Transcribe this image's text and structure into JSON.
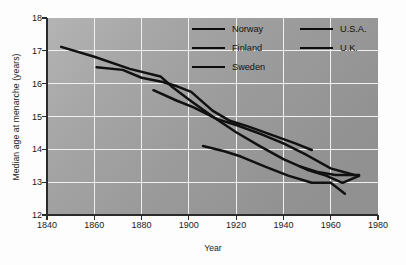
{
  "chart_data": {
    "type": "line",
    "title": "",
    "xlabel": "Year",
    "ylabel": "Median age at menarche (years)",
    "xlim": [
      1840,
      1980
    ],
    "ylim": [
      12,
      18
    ],
    "xticks": [
      1840,
      1860,
      1880,
      1900,
      1920,
      1940,
      1960,
      1980
    ],
    "yticks": [
      12,
      13,
      14,
      15,
      16,
      17,
      18
    ],
    "grid": true,
    "legend_position": "top-center",
    "line_color": "#111111",
    "plot_background": "#9a9a9a",
    "grid_color": "#f2f2f2",
    "series": [
      {
        "name": "Norway",
        "points": [
          [
            1846,
            17.12
          ],
          [
            1860,
            16.82
          ],
          [
            1875,
            16.45
          ],
          [
            1888,
            16.22
          ],
          [
            1893,
            15.9
          ],
          [
            1900,
            15.52
          ],
          [
            1910,
            15.0
          ],
          [
            1920,
            14.52
          ],
          [
            1930,
            14.1
          ],
          [
            1940,
            13.7
          ],
          [
            1950,
            13.38
          ],
          [
            1958,
            13.2
          ],
          [
            1965,
            12.98
          ],
          [
            1972,
            13.19
          ]
        ]
      },
      {
        "name": "Finland",
        "points": [
          [
            1861,
            16.5
          ],
          [
            1872,
            16.42
          ],
          [
            1880,
            16.18
          ],
          [
            1889,
            16.05
          ],
          [
            1895,
            15.92
          ],
          [
            1901,
            15.75
          ],
          [
            1910,
            15.18
          ],
          [
            1917,
            14.88
          ],
          [
            1925,
            14.7
          ],
          [
            1935,
            14.44
          ],
          [
            1945,
            14.18
          ],
          [
            1952,
            13.98
          ]
        ]
      },
      {
        "name": "Sweden",
        "points": [
          [
            1885,
            15.8
          ],
          [
            1895,
            15.48
          ],
          [
            1902,
            15.28
          ],
          [
            1912,
            14.92
          ],
          [
            1920,
            14.74
          ],
          [
            1930,
            14.48
          ],
          [
            1940,
            14.18
          ],
          [
            1950,
            13.82
          ],
          [
            1960,
            13.42
          ],
          [
            1970,
            13.22
          ]
        ]
      },
      {
        "name": "U.S.A.",
        "points": [
          [
            1947,
            13.48
          ],
          [
            1955,
            13.3
          ],
          [
            1962,
            13.22
          ],
          [
            1972,
            13.22
          ]
        ]
      },
      {
        "name": "U.K.",
        "points": [
          [
            1906,
            14.1
          ],
          [
            1915,
            13.94
          ],
          [
            1922,
            13.78
          ],
          [
            1932,
            13.48
          ],
          [
            1942,
            13.2
          ],
          [
            1952,
            12.98
          ],
          [
            1960,
            12.98
          ],
          [
            1966,
            12.65
          ]
        ]
      }
    ],
    "legend_columns": [
      [
        "Norway",
        "Finland",
        "Sweden"
      ],
      [
        "U.S.A.",
        "U.K."
      ]
    ]
  },
  "axis": {
    "x_tick_labels": [
      "1840",
      "1860",
      "1880",
      "1900",
      "1920",
      "1940",
      "1960",
      "1980"
    ],
    "y_tick_labels": [
      "12",
      "13",
      "14",
      "15",
      "16",
      "17",
      "18"
    ],
    "x_title": "Year",
    "y_title": "Median age at menarche (years)"
  },
  "legend": {
    "items": [
      {
        "label": "Norway"
      },
      {
        "label": "Finland"
      },
      {
        "label": "Sweden"
      },
      {
        "label": "U.S.A."
      },
      {
        "label": "U.K."
      }
    ]
  }
}
